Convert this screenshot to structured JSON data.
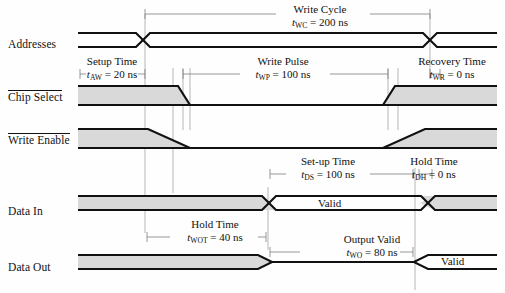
{
  "figure": {
    "type": "timing-diagram",
    "title_visible": false,
    "background": "#ffffff",
    "line_color": "#111111",
    "fill_color": "#d9d9d9",
    "guide_color": "#9a9a9a"
  },
  "signals": [
    {
      "id": "addresses",
      "label": "Addresses",
      "overline": false,
      "y": 45
    },
    {
      "id": "chip-select",
      "label": "Chip Select",
      "overline": true,
      "y": 98
    },
    {
      "id": "write-enable",
      "label": "Write Enable",
      "overline": true,
      "y": 141
    },
    {
      "id": "data-in",
      "label": "Data In",
      "overline": false,
      "y": 212
    },
    {
      "id": "data-out",
      "label": "Data Out",
      "overline": false,
      "y": 268
    }
  ],
  "annotations": [
    {
      "id": "write-cycle",
      "name": "Write Cycle",
      "symbol": "t",
      "subscript": "WC",
      "value": "200 ns",
      "equation": "= 200 ns",
      "x": 320,
      "y": 6
    },
    {
      "id": "setup-time-aw",
      "name": "Setup Time",
      "symbol": "t",
      "subscript": "AW",
      "value": "20 ns",
      "equation": "= 20 ns",
      "x": 112,
      "y": 58
    },
    {
      "id": "write-pulse",
      "name": "Write Pulse",
      "symbol": "t",
      "subscript": "WP",
      "value": "100 ns",
      "equation": "= 100 ns",
      "x": 283,
      "y": 58
    },
    {
      "id": "recovery-time",
      "name": "Recovery Time",
      "symbol": "t",
      "subscript": "WR",
      "value": "0 ns",
      "equation": "= 0 ns",
      "x": 450,
      "y": 58
    },
    {
      "id": "setup-time-ds",
      "name": "Set-up Time",
      "symbol": "t",
      "subscript": "DS",
      "value": "100 ns",
      "equation": "= 100 ns",
      "x": 328,
      "y": 158
    },
    {
      "id": "hold-time-dh",
      "name": "Hold Time",
      "symbol": "t",
      "subscript": "DH",
      "value": "0 ns",
      "equation": "= 0 ns",
      "x": 434,
      "y": 158
    },
    {
      "id": "hold-time-wot",
      "name": "Hold Time",
      "symbol": "t",
      "subscript": "WOT",
      "value": "40 ns",
      "equation": "= 40 ns",
      "x": 215,
      "y": 221
    },
    {
      "id": "output-valid",
      "name": "Output Valid",
      "symbol": "t",
      "subscript": "WO",
      "value": "80 ns",
      "equation": "= 80 ns",
      "x": 372,
      "y": 236
    }
  ],
  "wave_labels": [
    {
      "id": "data-in-valid",
      "text": "Valid",
      "x": 333,
      "y": 206
    },
    {
      "id": "data-out-valid",
      "text": "Valid",
      "x": 456,
      "y": 262
    }
  ]
}
